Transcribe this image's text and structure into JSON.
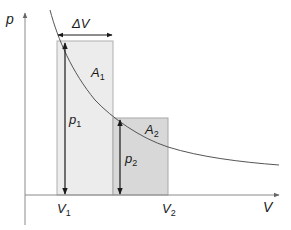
{
  "diagram": {
    "axes": {
      "y_label": "p",
      "x_label": "V"
    },
    "ticks": {
      "v1": "V",
      "v1_sub": "1",
      "v2": "V",
      "v2_sub": "2"
    },
    "delta_v": {
      "label": "ΔV"
    },
    "areas": [
      {
        "label": "A",
        "sub": "1",
        "fill": "#ececec"
      },
      {
        "label": "A",
        "sub": "2",
        "fill": "#d8d8d8"
      }
    ],
    "pressures": [
      {
        "label": "p",
        "sub": "1"
      },
      {
        "label": "p",
        "sub": "2"
      }
    ],
    "colors": {
      "axis": "#8a8a8a",
      "curve": "#555555",
      "arrow": "#1a1a1a",
      "rect_border": "#a8a8a8"
    }
  }
}
